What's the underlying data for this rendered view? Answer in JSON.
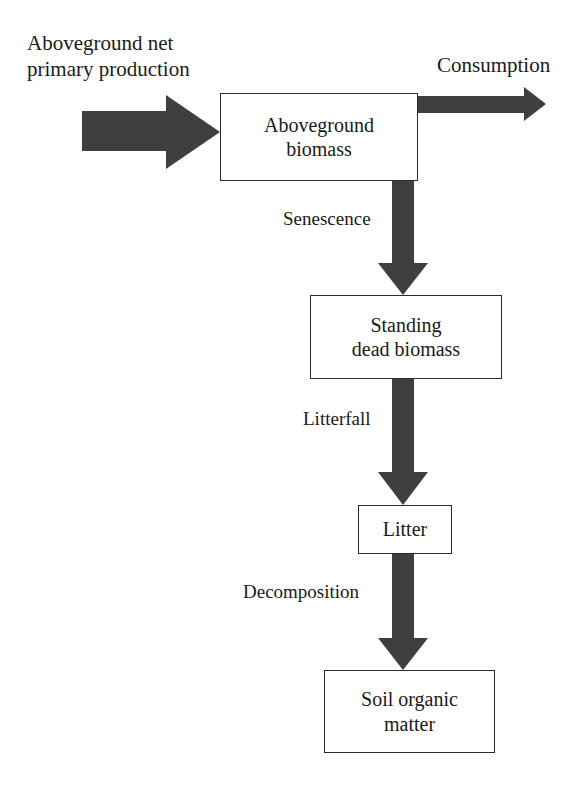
{
  "diagram": {
    "background_color": "#ffffff",
    "arrow_color": "#3a3a3a",
    "box_border_color": "#2b2b2b",
    "text_color": "#1a1a1a"
  },
  "captions": {
    "source_line1": "Aboveground net",
    "source_line2": "primary production",
    "consumption": "Consumption"
  },
  "nodes": [
    {
      "id": "aboveground-biomass",
      "line1": "Aboveground",
      "line2": "biomass"
    },
    {
      "id": "standing-dead-biomass",
      "line1": "Standing",
      "line2": "dead biomass"
    },
    {
      "id": "litter",
      "line1": "Litter",
      "line2": ""
    },
    {
      "id": "soil-organic-matter",
      "line1": "Soil organic",
      "line2": "matter"
    }
  ],
  "flow_labels": {
    "senescence": "Senescence",
    "litterfall": "Litterfall",
    "decomposition": "Decomposition"
  },
  "arrows": [
    {
      "id": "anpp-input-arrow",
      "direction": "right",
      "from": "aboveground net primary production",
      "to": "aboveground-biomass"
    },
    {
      "id": "consumption-arrow",
      "direction": "right",
      "from": "aboveground-biomass",
      "to": "consumption"
    },
    {
      "id": "senescence-arrow",
      "direction": "down",
      "from": "aboveground-biomass",
      "to": "standing-dead-biomass"
    },
    {
      "id": "litterfall-arrow",
      "direction": "down",
      "from": "standing-dead-biomass",
      "to": "litter"
    },
    {
      "id": "decomposition-arrow",
      "direction": "down",
      "from": "litter",
      "to": "soil-organic-matter"
    }
  ]
}
